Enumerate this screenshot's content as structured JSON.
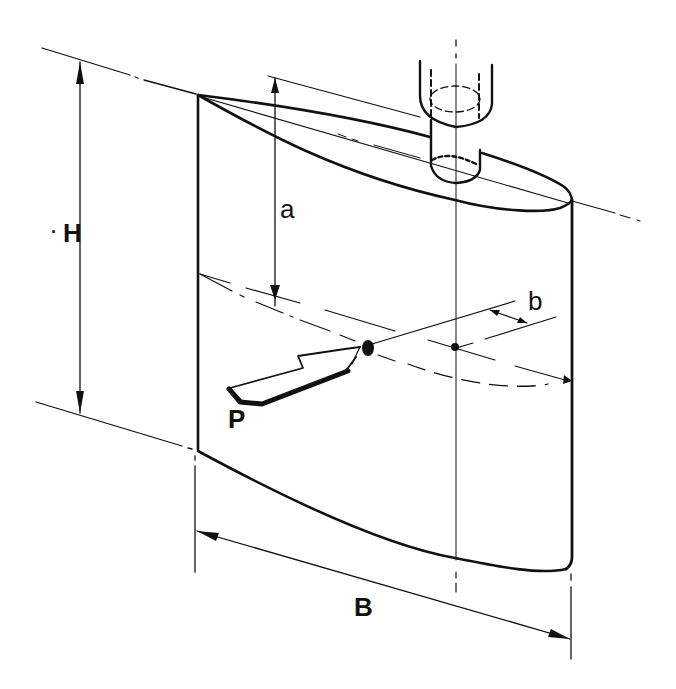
{
  "figure": {
    "colors": {
      "ink": "#111111",
      "background": "#ffffff"
    }
  },
  "labels": {
    "height": "H",
    "height_prefix": "·",
    "cp_vertical_offset": "a",
    "cp_horizontal_offset": "b",
    "force": "P",
    "breadth": "B"
  },
  "icons": {
    "force_arrow": "hollow-arrow-icon",
    "center_of_pressure": "filled-dot-icon",
    "axis_point": "small-dot-icon"
  }
}
